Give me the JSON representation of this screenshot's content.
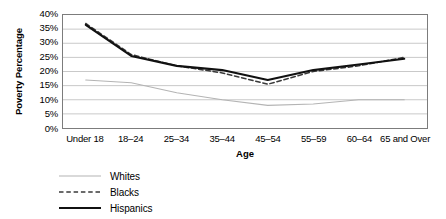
{
  "chart_data": {
    "type": "line",
    "title": "",
    "xlabel": "Age",
    "ylabel": "Poverty Percentage",
    "categories": [
      "Under 18",
      "18–24",
      "25–34",
      "35–44",
      "45–54",
      "55–59",
      "60–64",
      "65 and Over"
    ],
    "ylim": [
      0,
      40
    ],
    "ytick_labels": [
      "40%",
      "35%",
      "30%",
      "25%",
      "20%",
      "15%",
      "10%",
      "5%",
      "0%"
    ],
    "ytick_values": [
      40,
      35,
      30,
      25,
      20,
      15,
      10,
      5,
      0
    ],
    "grid": true,
    "grid_axis": "y",
    "legend_position": "bottom-left",
    "series": [
      {
        "name": "Whites",
        "values": [
          17,
          16,
          12.5,
          10,
          8,
          8.5,
          10,
          10
        ],
        "color": "#b4b4b4",
        "style": "solid",
        "width": 1.1
      },
      {
        "name": "Blacks",
        "values": [
          37,
          26,
          22,
          19.5,
          15.5,
          20,
          22,
          25
        ],
        "color": "#3a3a3a",
        "style": "dashed",
        "width": 1.5
      },
      {
        "name": "Hispanics",
        "values": [
          36.5,
          25.5,
          22,
          20.5,
          17,
          20.5,
          22.5,
          24.5
        ],
        "color": "#111111",
        "style": "solid",
        "width": 2.1
      }
    ]
  },
  "legend": {
    "items": [
      {
        "label": "Whites"
      },
      {
        "label": "Blacks"
      },
      {
        "label": "Hispanics"
      }
    ]
  },
  "colors": {
    "plot_border": "#7c7c7c",
    "gridline": "#c9c9c9",
    "background": "#ffffff",
    "text": "#000000"
  }
}
